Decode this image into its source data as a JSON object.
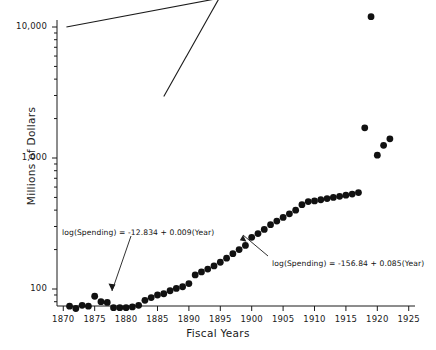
{
  "chart_data": {
    "type": "scatter",
    "title": "",
    "xlabel": "Fiscal Years",
    "ylabel": "Millions of Dollars",
    "yscale": "log",
    "xlim": [
      1869,
      1926
    ],
    "ylim": [
      60,
      16000
    ],
    "grid": false,
    "legend": null,
    "x_ticks": [
      "1870",
      "1875",
      "1880",
      "1885",
      "1890",
      "1895",
      "1900",
      "1905",
      "1910",
      "1915",
      "1920",
      "1925"
    ],
    "x_tick_values": [
      1870,
      1875,
      1880,
      1885,
      1890,
      1895,
      1900,
      1905,
      1910,
      1915,
      1920,
      1925
    ],
    "y_ticks": [
      "100",
      "1,000",
      "10,000"
    ],
    "y_tick_values": [
      100,
      1000,
      10000
    ],
    "y_minor_ticks": [
      200,
      300,
      400,
      500,
      600,
      700,
      800,
      900,
      2000,
      3000,
      4000,
      5000,
      6000,
      7000,
      8000,
      9000
    ],
    "marker": "filled-circle",
    "marker_color": "#111111",
    "marker_size": 3.4,
    "series": [
      {
        "name": "Federal Spending",
        "x": [
          1871,
          1872,
          1873,
          1874,
          1875,
          1876,
          1877,
          1878,
          1879,
          1880,
          1881,
          1882,
          1883,
          1884,
          1885,
          1886,
          1887,
          1888,
          1889,
          1890,
          1891,
          1892,
          1893,
          1894,
          1895,
          1896,
          1897,
          1898,
          1899,
          1900,
          1901,
          1902,
          1903,
          1904,
          1905,
          1906,
          1907,
          1908,
          1909,
          1910,
          1911,
          1912,
          1913,
          1914,
          1915,
          1916,
          1917,
          1918,
          1919,
          1920,
          1921,
          1922
        ],
        "y": [
          74,
          71,
          75,
          74,
          88,
          80,
          79,
          72,
          72,
          72,
          73,
          75,
          82,
          86,
          90,
          92,
          97,
          101,
          104,
          110,
          128,
          135,
          142,
          150,
          160,
          172,
          186,
          200,
          215,
          248,
          265,
          285,
          310,
          330,
          352,
          375,
          400,
          440,
          465,
          470,
          480,
          490,
          500,
          510,
          520,
          530,
          545,
          1700,
          12000,
          1050,
          1250,
          1400
        ]
      }
    ],
    "fit_lines": [
      {
        "name": "early-period-fit",
        "equation": "log(Spending) = -12.834 + 0.009(Year)",
        "intercept": -12.834,
        "slope": 0.009,
        "x_start": 1870.5,
        "x_end": 1894.0
      },
      {
        "name": "late-period-fit",
        "equation": "log(Spending) = -156.84 + 0.085(Year)",
        "intercept": -156.84,
        "slope": 0.085,
        "x_start": 1886.0,
        "x_end": 1921.0
      }
    ],
    "annotations": [
      {
        "name": "early-fit-annotation",
        "text": "log(Spending) = -12.834 + 0.009(Year)",
        "text_x_px": 62,
        "text_y_px": 228,
        "leader_from_px": [
          131,
          236
        ],
        "leader_to_px": [
          112,
          291
        ]
      },
      {
        "name": "late-fit-annotation",
        "text": "log(Spending) = -156.84 + 0.085(Year)",
        "text_x_px": 272,
        "text_y_px": 259,
        "leader_from_px": [
          268,
          256
        ],
        "leader_to_px": [
          243,
          235
        ]
      }
    ]
  }
}
